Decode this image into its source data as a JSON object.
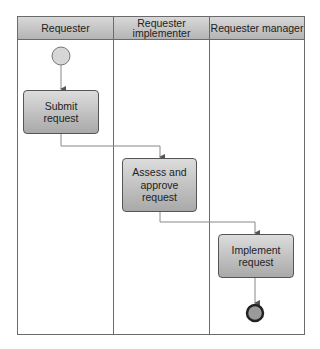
{
  "diagram": {
    "type": "swimlane-process",
    "lanes": [
      {
        "label": "Requester"
      },
      {
        "label": "Requester\nimplementer"
      },
      {
        "label": "Requester manager"
      }
    ],
    "tasks": [
      {
        "label": "Submit\nrequest"
      },
      {
        "label": "Assess and\napprove\nrequest"
      },
      {
        "label": "Implement\nrequest"
      }
    ],
    "events": {
      "start": "start-event",
      "end": "end-event"
    },
    "colors": {
      "border": "#555555",
      "header_top": "#d8d8d8",
      "header_bottom": "#b4b4b4",
      "task_top": "#dcdcdc",
      "task_bottom": "#a9a9a9",
      "line": "#777777"
    }
  }
}
